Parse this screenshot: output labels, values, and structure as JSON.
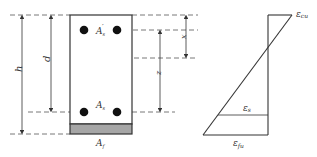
{
  "section": {
    "labels": {
      "h": "h",
      "d": "d",
      "x": "x",
      "z": "z",
      "As_prime": "A",
      "As_prime_sub": "s",
      "As_prime_mark": "′",
      "As": "A",
      "As_sub": "s",
      "Af": "A",
      "Af_sub": "f"
    }
  },
  "strain": {
    "labels": {
      "eps_cu": "ε",
      "eps_cu_sub": "cu",
      "eps_s": "ε",
      "eps_s_sub": "s",
      "eps_fu": "ε",
      "eps_fu_sub": "fu"
    }
  },
  "colors": {
    "line": "#333333",
    "dash": "#555555",
    "frp_fill": "#a6a6a6",
    "bar_fill": "#111111"
  }
}
